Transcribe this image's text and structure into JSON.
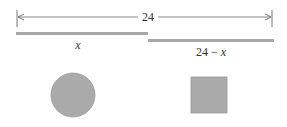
{
  "diagram": {
    "total_label": "24",
    "piece_left_label": "x",
    "piece_right_label": "24 − x",
    "shapes": [
      "circle",
      "square"
    ],
    "colors": {
      "line": "#777777",
      "bar": "#a8a8a8",
      "fill": "#aaaaaa",
      "text": "#333333"
    }
  }
}
